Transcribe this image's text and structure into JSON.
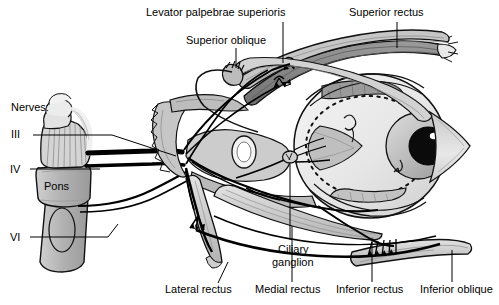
{
  "figure": {
    "colors": {
      "ink": "#000000",
      "background": "#ffffff",
      "globe": "#ebebeb",
      "muscle_light": "#dcdcdc",
      "muscle_mid": "#bcbcbc",
      "muscle_dark": "#8f8f8f",
      "brainstem": "#b8b8b8",
      "brainstem_light": "#d8d8d8",
      "iris": "#b9b9b9",
      "pupil": "#0a0a0a",
      "nerve_trunk": "#000000"
    }
  },
  "labels": {
    "levator": "Levator palpebrae superioris",
    "superior_oblique": "Superior oblique",
    "superior_rectus": "Superior rectus",
    "nerves_heading": "Nerves:",
    "nerve_iii": "III",
    "nerve_iv": "IV",
    "nerve_vi": "VI",
    "pons": "Pons",
    "ciliary_ganglion_line1": "Ciliary",
    "ciliary_ganglion_line2": "ganglion",
    "lateral_rectus": "Lateral rectus",
    "medial_rectus": "Medial rectus",
    "inferior_rectus": "Inferior rectus",
    "inferior_oblique": "Inferior oblique"
  }
}
